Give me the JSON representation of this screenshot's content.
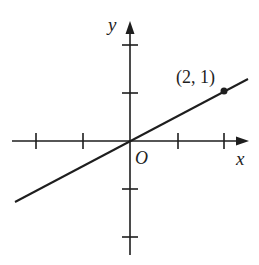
{
  "diagram": {
    "type": "coordinate-plane-line",
    "labels": {
      "x_axis": "x",
      "y_axis": "y",
      "origin": "O",
      "point": "(2, 1)"
    },
    "point": {
      "x": 2,
      "y": 1
    },
    "line": {
      "passes_through": [
        [
          0,
          0
        ],
        [
          2,
          1
        ]
      ],
      "slope": 0.5
    },
    "ticks": {
      "x": [
        -3,
        -2,
        -1,
        1,
        2
      ],
      "y": [
        -2,
        -1,
        1,
        2
      ]
    },
    "colors": {
      "ink": "#1e1e1e",
      "background": "#ffffff"
    }
  }
}
